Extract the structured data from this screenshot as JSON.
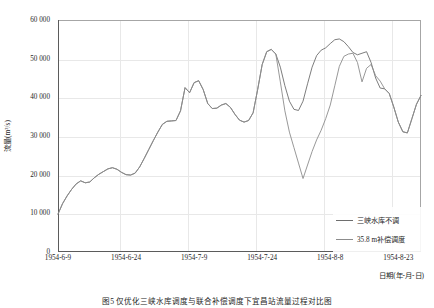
{
  "figure": {
    "caption": "图5   仅优化三峡水库调度与联合补偿调度下宜昌站流量过程对比图"
  },
  "axes": {
    "y_title": "流量(m³/s)",
    "x_title": "日期(年-月-日)",
    "y_ticks": [
      "0",
      "10 000",
      "20 000",
      "30 000",
      "40 000",
      "50 000",
      "60 000"
    ],
    "x_ticks": [
      "1954-6-9",
      "1954-6-24",
      "1954-7-9",
      "1954-7-24",
      "1954-8-8",
      "1954-8-23"
    ]
  },
  "legend": {
    "items": [
      {
        "label": "三峡水库不调",
        "color": "#6e6e6e"
      },
      {
        "label": "35.8 m补偿调度",
        "color": "#8c8c8c"
      }
    ]
  },
  "chart_data": {
    "type": "line",
    "title": "",
    "xlabel": "日期(年-月-日)",
    "ylabel": "流量(m³/s)",
    "ylim": [
      0,
      60000
    ],
    "ytick_step": 10000,
    "grid": true,
    "legend_position": "bottom-right",
    "x_start": "1954-6-9",
    "x_end": "1954-8-28",
    "x_tick_interval_days": 15,
    "x": [
      "1954-6-9",
      "1954-6-10",
      "1954-6-11",
      "1954-6-12",
      "1954-6-13",
      "1954-6-14",
      "1954-6-15",
      "1954-6-16",
      "1954-6-17",
      "1954-6-18",
      "1954-6-19",
      "1954-6-20",
      "1954-6-21",
      "1954-6-22",
      "1954-6-23",
      "1954-6-24",
      "1954-6-25",
      "1954-6-26",
      "1954-6-27",
      "1954-6-28",
      "1954-6-29",
      "1954-6-30",
      "1954-7-1",
      "1954-7-2",
      "1954-7-3",
      "1954-7-4",
      "1954-7-5",
      "1954-7-6",
      "1954-7-7",
      "1954-7-8",
      "1954-7-9",
      "1954-7-10",
      "1954-7-11",
      "1954-7-12",
      "1954-7-13",
      "1954-7-14",
      "1954-7-15",
      "1954-7-16",
      "1954-7-17",
      "1954-7-18",
      "1954-7-19",
      "1954-7-20",
      "1954-7-21",
      "1954-7-22",
      "1954-7-23",
      "1954-7-24",
      "1954-7-25",
      "1954-7-26",
      "1954-7-27",
      "1954-7-28",
      "1954-7-29",
      "1954-7-30",
      "1954-7-31",
      "1954-8-1",
      "1954-8-2",
      "1954-8-3",
      "1954-8-4",
      "1954-8-5",
      "1954-8-6",
      "1954-8-7",
      "1954-8-8",
      "1954-8-9",
      "1954-8-10",
      "1954-8-11",
      "1954-8-12",
      "1954-8-13",
      "1954-8-14",
      "1954-8-15",
      "1954-8-16",
      "1954-8-17",
      "1954-8-18",
      "1954-8-19",
      "1954-8-20",
      "1954-8-21",
      "1954-8-22",
      "1954-8-23",
      "1954-8-24",
      "1954-8-25",
      "1954-8-26",
      "1954-8-27",
      "1954-8-28"
    ],
    "series": [
      {
        "name": "三峡水库不调",
        "color": "#6e6e6e",
        "values": [
          9800,
          12500,
          14500,
          16200,
          17600,
          18400,
          17900,
          18100,
          19200,
          20100,
          20800,
          21500,
          21800,
          21400,
          20600,
          20000,
          19900,
          20400,
          22000,
          24200,
          26500,
          28800,
          31000,
          33000,
          33800,
          33900,
          34000,
          36500,
          42500,
          41200,
          43800,
          44300,
          42000,
          38400,
          37100,
          37200,
          38000,
          38400,
          37400,
          35600,
          34100,
          33600,
          34000,
          36000,
          42000,
          48500,
          51800,
          52400,
          51200,
          47800,
          43000,
          39000,
          36900,
          36600,
          39000,
          43500,
          47800,
          50800,
          52200,
          52800,
          53900,
          54900,
          55100,
          54400,
          53100,
          51600,
          51000,
          51400,
          51800,
          49000,
          45000,
          42400,
          42200,
          41000,
          37500,
          33600,
          31100,
          30800,
          34500,
          38200,
          40500
        ]
      },
      {
        "name": "35.8 m补偿调度",
        "color": "#8c8c8c",
        "values": [
          9800,
          12500,
          14500,
          16200,
          17600,
          18400,
          17900,
          18100,
          19200,
          20100,
          20800,
          21500,
          21800,
          21400,
          20600,
          20000,
          19900,
          20400,
          22000,
          24200,
          26500,
          28800,
          31000,
          33000,
          33800,
          33900,
          34000,
          36500,
          42500,
          41200,
          43800,
          44300,
          42000,
          38400,
          37100,
          37200,
          38000,
          38400,
          37400,
          35600,
          34100,
          33600,
          34000,
          36000,
          42000,
          48500,
          51800,
          52400,
          51200,
          44000,
          36500,
          31000,
          27000,
          23000,
          19000,
          22500,
          26000,
          29000,
          31500,
          34500,
          38000,
          43000,
          48000,
          50600,
          51200,
          51400,
          49000,
          44000,
          47500,
          48500,
          45600,
          44200,
          42200,
          41000,
          37500,
          33600,
          31100,
          30800,
          34500,
          38200,
          40500
        ]
      }
    ]
  }
}
